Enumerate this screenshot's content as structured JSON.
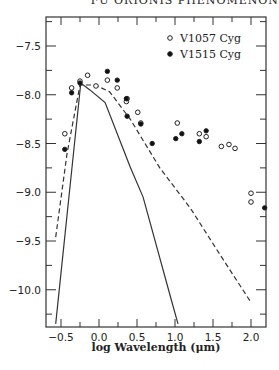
{
  "header": {
    "running_title": "FU ORIONIS PHENOMENON"
  },
  "chart_data": {
    "type": "scatter",
    "title": "",
    "xlabel": "log Wavelength (μm)",
    "ylabel": "",
    "xlim": [
      -0.72,
      2.2
    ],
    "ylim": [
      -10.35,
      -7.2
    ],
    "xticks": [
      -0.5,
      0.0,
      0.5,
      1.0,
      1.5,
      2.0
    ],
    "xtick_labels": [
      "-0.5",
      "0.0",
      "0.5",
      "1.0",
      "1.5",
      "2.0"
    ],
    "yticks": [
      -7.5,
      -8.0,
      -8.5,
      -9.0,
      -9.5,
      -10.0
    ],
    "ytick_labels": [
      "-7.5",
      "-8.0",
      "-8.5",
      "-9.0",
      "-9.5",
      "-10.0"
    ],
    "grid": false,
    "legend_position": "upper right",
    "series": [
      {
        "name": "V1057 Cyg",
        "marker": "open-circle",
        "points": [
          [
            -0.45,
            -8.4
          ],
          [
            -0.36,
            -7.93
          ],
          [
            -0.25,
            -7.86
          ],
          [
            -0.15,
            -7.8
          ],
          [
            -0.04,
            -7.91
          ],
          [
            0.11,
            -7.85
          ],
          [
            0.24,
            -7.93
          ],
          [
            0.36,
            -8.07
          ],
          [
            0.37,
            -8.04
          ],
          [
            0.55,
            -8.29
          ],
          [
            0.51,
            -8.18
          ],
          [
            1.03,
            -8.29
          ],
          [
            1.32,
            -8.4
          ],
          [
            1.41,
            -8.43
          ],
          [
            1.61,
            -8.53
          ],
          [
            1.71,
            -8.51
          ],
          [
            1.79,
            -8.55
          ],
          [
            2.0,
            -9.01
          ],
          [
            2.0,
            -9.1
          ]
        ]
      },
      {
        "name": "V1515 Cyg",
        "marker": "filled-circle",
        "points": [
          [
            -0.45,
            -8.56
          ],
          [
            -0.36,
            -7.98
          ],
          [
            -0.25,
            -7.88
          ],
          [
            0.11,
            -7.76
          ],
          [
            0.24,
            -7.85
          ],
          [
            0.36,
            -8.04
          ],
          [
            0.55,
            -8.3
          ],
          [
            0.7,
            -8.5
          ],
          [
            0.37,
            -8.22
          ],
          [
            1.01,
            -8.45
          ],
          [
            1.09,
            -8.4
          ],
          [
            1.32,
            -8.48
          ],
          [
            1.41,
            -8.37
          ],
          [
            2.18,
            -9.16
          ]
        ]
      },
      {
        "name": "model-solid",
        "style": "solid-line",
        "points": [
          [
            -0.57,
            -10.35
          ],
          [
            -0.24,
            -7.88
          ],
          [
            -0.12,
            -7.95
          ],
          [
            0.08,
            -8.08
          ],
          [
            0.41,
            -8.74
          ],
          [
            0.58,
            -9.05
          ],
          [
            0.95,
            -10.1
          ],
          [
            1.04,
            -10.35
          ]
        ]
      },
      {
        "name": "model-dashed",
        "style": "dashed-line",
        "points": [
          [
            -0.57,
            -9.46
          ],
          [
            -0.42,
            -8.6
          ],
          [
            -0.25,
            -7.9
          ],
          [
            -0.05,
            -7.9
          ],
          [
            0.14,
            -7.97
          ],
          [
            0.41,
            -8.25
          ],
          [
            0.8,
            -8.75
          ],
          [
            1.2,
            -9.16
          ],
          [
            1.6,
            -9.65
          ],
          [
            2.0,
            -10.13
          ]
        ]
      }
    ]
  },
  "legend": {
    "items": [
      {
        "label": "V1057 Cyg",
        "marker": "open-circle"
      },
      {
        "label": "V1515 Cyg",
        "marker": "filled-circle"
      }
    ]
  }
}
